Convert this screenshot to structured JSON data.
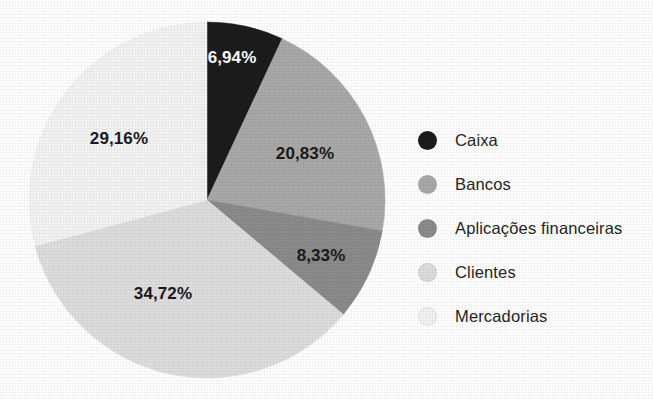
{
  "chart_data": {
    "type": "pie",
    "title": "",
    "subtitle": "",
    "xlabel": "",
    "ylabel": "",
    "grid": false,
    "legend_position": "right",
    "value_suffix": "%",
    "decimal_separator": ",",
    "start_angle_deg": 0,
    "direction": "clockwise",
    "categories": [
      "Caixa",
      "Bancos",
      "Aplicações financeiras",
      "Clientes",
      "Mercadorias"
    ],
    "values": [
      6.94,
      20.83,
      8.33,
      34.72,
      29.16
    ],
    "labels": [
      "6,94%",
      "20,83%",
      "8,33%",
      "34,72%",
      "29,16%"
    ],
    "colors": [
      "#1c1c1c",
      "#a9a9a9",
      "#8b8b8b",
      "#dedede",
      "#f3f3f3"
    ],
    "label_text_colors": [
      "#ffffff",
      "#1a1a1a",
      "#1a1a1a",
      "#1a1a1a",
      "#1a1a1a"
    ],
    "slices": [
      {
        "name": "Caixa",
        "value": 6.94,
        "label": "6,94%",
        "color": "#1c1c1c",
        "label_color": "#ffffff"
      },
      {
        "name": "Bancos",
        "value": 20.83,
        "label": "20,83%",
        "color": "#a9a9a9",
        "label_color": "#1a1a1a"
      },
      {
        "name": "Aplicações financeiras",
        "value": 8.33,
        "label": "8,33%",
        "color": "#8b8b8b",
        "label_color": "#1a1a1a"
      },
      {
        "name": "Clientes",
        "value": 34.72,
        "label": "34,72%",
        "color": "#dedede",
        "label_color": "#1a1a1a"
      },
      {
        "name": "Mercadorias",
        "value": 29.16,
        "label": "29,16%",
        "color": "#f3f3f3",
        "label_color": "#1a1a1a"
      }
    ]
  },
  "legend": {
    "items": [
      {
        "label": "Caixa",
        "color": "#1c1c1c"
      },
      {
        "label": "Bancos",
        "color": "#a9a9a9"
      },
      {
        "label": "Aplicações financeiras",
        "color": "#8b8b8b"
      },
      {
        "label": "Clientes",
        "color": "#dedede"
      },
      {
        "label": "Mercadorias",
        "color": "#f3f3f3"
      }
    ]
  },
  "slice_labels": {
    "caixa": "6,94%",
    "bancos": "20,83%",
    "aplicacoes": "8,33%",
    "clientes": "34,72%",
    "mercadorias": "29,16%"
  }
}
